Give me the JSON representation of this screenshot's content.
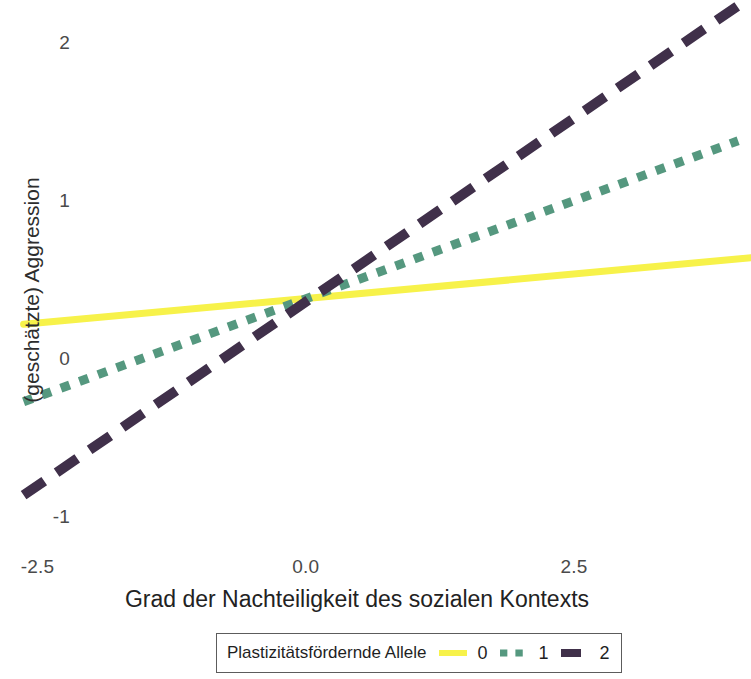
{
  "chart_data": {
    "type": "line",
    "title": "",
    "xlabel": "Grad der Nachteiligkeit des sozialen Kontexts",
    "ylabel": "(geschätzte) Aggression",
    "xlim": [
      -2.85,
      4.15
    ],
    "ylim": [
      -1.27,
      2.27
    ],
    "xticks": [
      -2.5,
      0.0,
      2.5
    ],
    "xticklabels": [
      "-2.5",
      "0.0",
      "2.5"
    ],
    "yticks": [
      -1,
      0,
      1,
      2
    ],
    "yticklabels": [
      "-1",
      "0",
      "1",
      "2"
    ],
    "grid": false,
    "legend": {
      "position": "below-outside",
      "title": "Plastizitätsfördernde Allele",
      "entries": [
        {
          "label": "0",
          "color": "#f7f24a",
          "dash": "solid"
        },
        {
          "label": "1",
          "color": "#55987f",
          "dash": "dotted"
        },
        {
          "label": "2",
          "color": "#40304a",
          "dash": "dashed"
        }
      ]
    },
    "series": [
      {
        "name": "0",
        "color": "#f7f24a",
        "dash": "solid",
        "x": [
          -2.63,
          4.15
        ],
        "y": [
          0.22,
          0.64
        ]
      },
      {
        "name": "1",
        "color": "#55987f",
        "dash": "dotted",
        "x": [
          -2.63,
          4.03
        ],
        "y": [
          -0.27,
          1.38
        ]
      },
      {
        "name": "2",
        "color": "#40304a",
        "dash": "dashed",
        "x": [
          -2.63,
          4.15
        ],
        "y": [
          -0.86,
          2.29
        ]
      }
    ]
  }
}
